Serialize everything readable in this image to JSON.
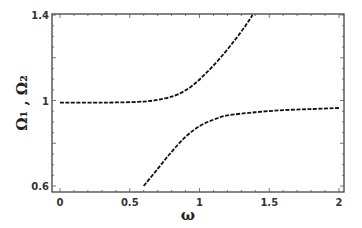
{
  "chart_data": {
    "type": "line",
    "title": "",
    "xlabel": "ω",
    "ylabel": "Ω₁ , Ω₂",
    "xlim": [
      0,
      2.05
    ],
    "ylim": [
      0.6,
      1.4
    ],
    "x_ticks": [
      "0",
      "0.5",
      "1",
      "1.5",
      "2"
    ],
    "y_ticks": [
      "0.6",
      "1",
      "1.4"
    ],
    "grid": false,
    "legend": null,
    "series": [
      {
        "name": "Ω1 (upper branch)",
        "style": "solid to dashed",
        "x": [
          0,
          0.3,
          0.6,
          0.75,
          0.85,
          0.95,
          1.05,
          1.15,
          1.25,
          1.33,
          1.38
        ],
        "y": [
          0.99,
          0.99,
          0.995,
          1.01,
          1.03,
          1.07,
          1.13,
          1.2,
          1.28,
          1.35,
          1.4
        ]
      },
      {
        "name": "Ω2 (lower branch)",
        "style": "solid to dashed",
        "x": [
          0.6,
          0.7,
          0.8,
          0.9,
          1.0,
          1.1,
          1.2,
          1.4,
          1.6,
          1.8,
          2.0
        ],
        "y": [
          0.6,
          0.68,
          0.76,
          0.83,
          0.88,
          0.91,
          0.93,
          0.945,
          0.955,
          0.96,
          0.965
        ]
      }
    ]
  }
}
